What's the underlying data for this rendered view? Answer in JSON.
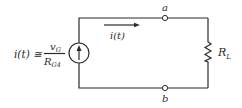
{
  "diagram": {
    "type": "circuit",
    "source": {
      "kind": "current-source",
      "direction": "up",
      "expression": {
        "lhs": "i(t) ≅",
        "numerator": "v",
        "numerator_sub": "G",
        "denominator": "R",
        "denominator_sub": "G4"
      }
    },
    "current_label": "i(t)",
    "nodes": {
      "top": "a",
      "bottom": "b"
    },
    "load": {
      "kind": "resistor",
      "label": "R",
      "label_sub": "L"
    },
    "colors": {
      "line": "#2a2a2a",
      "background": "#ffffff"
    }
  }
}
